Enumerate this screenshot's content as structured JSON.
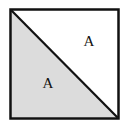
{
  "figure": {
    "name": "square-divided-by-diagonal",
    "background_color": "#ffffff",
    "canvas": {
      "width": 127,
      "height": 129
    },
    "square": {
      "name": "outer-square",
      "x": 10.5,
      "y": 9.5,
      "width": 108,
      "height": 109,
      "stroke_color": "#111111",
      "stroke_width": 2.5,
      "fill_color": "#ffffff"
    },
    "diagonal": {
      "name": "diagonal-line",
      "from": "top-left",
      "to": "bottom-right",
      "x1": 11.5,
      "y1": 10.5,
      "x2": 117.5,
      "y2": 117.5,
      "stroke_color": "#111111",
      "stroke_width": 2.2
    },
    "regions": [
      {
        "name": "lower-left-triangle",
        "label": "A",
        "fill_color": "#dcdcdc",
        "points": "11.5,10.5 11.5,117.5 117.5,117.5",
        "label_x": 48,
        "label_y": 85
      },
      {
        "name": "upper-right-triangle",
        "label": "A",
        "fill_color": "#ffffff",
        "points": "11.5,10.5 117.5,10.5 117.5,117.5",
        "label_x": 89,
        "label_y": 43
      }
    ]
  }
}
